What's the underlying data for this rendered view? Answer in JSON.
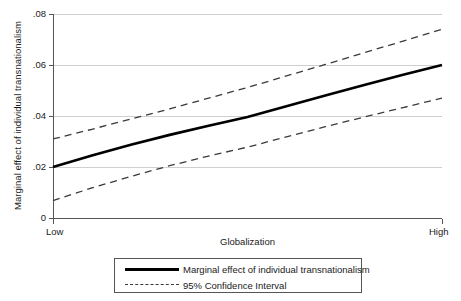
{
  "chart_data": {
    "type": "line",
    "title": "",
    "xlabel": "Globalization",
    "ylabel": "Marginal effect of individual transnationalism",
    "xlim": [
      0,
      1
    ],
    "ylim": [
      0,
      0.08
    ],
    "grid": true,
    "x_tick_labels": [
      "Low",
      "High"
    ],
    "x_tick_positions": [
      0,
      1
    ],
    "y_tick_labels": [
      "0",
      ".02",
      ".04",
      ".06",
      ".08"
    ],
    "y_tick_values": [
      0,
      0.02,
      0.04,
      0.06,
      0.08
    ],
    "legend_position": "below-plot",
    "series": [
      {
        "name": "Marginal effect of individual transnationalism",
        "style": "solid",
        "color": "#000000",
        "x": [
          0,
          0.1,
          0.2,
          0.3,
          0.4,
          0.5,
          0.6,
          0.7,
          0.8,
          0.9,
          1
        ],
        "values": [
          0.02,
          0.0245,
          0.0287,
          0.0326,
          0.0362,
          0.0396,
          0.0438,
          0.048,
          0.0522,
          0.0562,
          0.06
        ]
      },
      {
        "name": "95% Confidence Interval upper",
        "style": "dashed",
        "color": "#3a3a3a",
        "x": [
          0,
          0.1,
          0.2,
          0.3,
          0.4,
          0.5,
          0.6,
          0.7,
          0.8,
          0.9,
          1
        ],
        "values": [
          0.031,
          0.0348,
          0.0388,
          0.0428,
          0.047,
          0.0512,
          0.0557,
          0.0602,
          0.0648,
          0.0694,
          0.074
        ]
      },
      {
        "name": "95% Confidence Interval lower",
        "style": "dashed",
        "color": "#3a3a3a",
        "x": [
          0,
          0.1,
          0.2,
          0.3,
          0.4,
          0.5,
          0.6,
          0.7,
          0.8,
          0.9,
          1
        ],
        "values": [
          0.0068,
          0.0118,
          0.0163,
          0.0205,
          0.0243,
          0.0278,
          0.0318,
          0.0358,
          0.0396,
          0.0433,
          0.047
        ]
      }
    ],
    "legend": [
      {
        "label": "Marginal effect of individual transnationalism",
        "style": "solid"
      },
      {
        "label": "95% Confidence Interval",
        "style": "dashed"
      }
    ]
  }
}
